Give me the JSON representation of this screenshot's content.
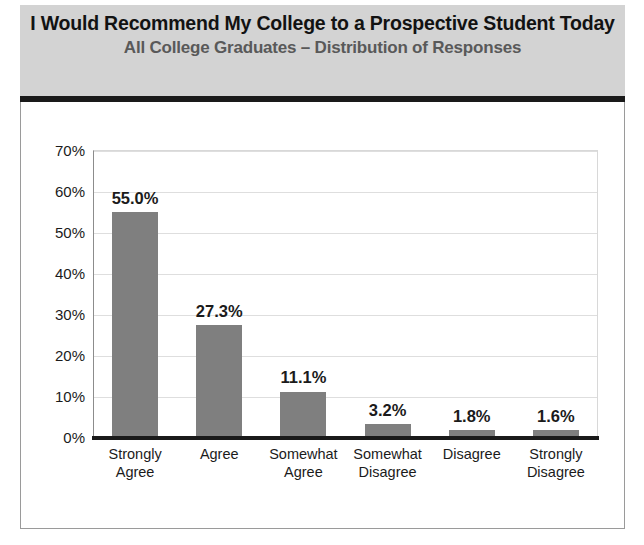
{
  "header": {
    "title": "I Would Recommend My College to a Prospective Student Today",
    "subtitle": "All College Graduates – Distribution of Responses",
    "band_color": "#d3d3d3",
    "rule_color": "#1a1a1a",
    "title_color": "#121212",
    "subtitle_color": "#595959"
  },
  "chart_data": {
    "type": "bar",
    "title": "I Would Recommend My College to a Prospective Student Today",
    "subtitle": "All College Graduates – Distribution of Responses",
    "xlabel": "",
    "ylabel": "",
    "ylim": [
      0,
      70
    ],
    "ytick_labels": [
      "0%",
      "10%",
      "20%",
      "30%",
      "40%",
      "50%",
      "60%",
      "70%"
    ],
    "ytick_values": [
      0,
      10,
      20,
      30,
      40,
      50,
      60,
      70
    ],
    "grid": true,
    "legend": false,
    "bar_color": "#7f7f7f",
    "categories": [
      "Strongly\nAgree",
      "Agree",
      "Somewhat\nAgree",
      "Somewhat\nDisagree",
      "Disagree",
      "Strongly\nDisagree"
    ],
    "values": [
      55.0,
      27.3,
      11.1,
      3.2,
      1.8,
      1.6
    ],
    "value_labels": [
      "55.0%",
      "27.3%",
      "11.1%",
      "3.2%",
      "1.8%",
      "1.6%"
    ]
  }
}
